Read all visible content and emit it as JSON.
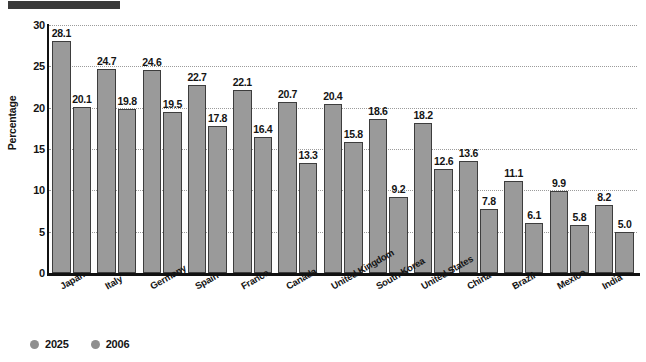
{
  "title_bar": {
    "name": "redacted-title-bar",
    "color": "#3a3a3a"
  },
  "chart_data": {
    "type": "bar",
    "title": "",
    "subtitle": "",
    "xlabel": "",
    "ylabel": "Percentage",
    "ylim": [
      0,
      30
    ],
    "yticks": [
      0,
      5,
      10,
      15,
      20,
      25,
      30
    ],
    "ytick_labels": [
      "0",
      "5",
      "10",
      "15",
      "20",
      "25",
      "30"
    ],
    "grid": true,
    "grid_style": "dotted",
    "legend_position": "bottom-left",
    "categories": [
      "Japan",
      "Italy",
      "Germany",
      "Spain",
      "France",
      "Canada",
      "United Kingdom",
      "South Korea",
      "United States",
      "China",
      "Brazil",
      "Mexico",
      "India"
    ],
    "series": [
      {
        "name": "2025",
        "color": "#9a9a9a",
        "values": [
          28.1,
          24.7,
          24.6,
          22.7,
          22.1,
          20.7,
          20.4,
          18.6,
          18.2,
          13.6,
          11.1,
          9.9,
          8.2
        ],
        "labels": [
          "28.1",
          "24.7",
          "24.6",
          "22.7",
          "22.1",
          "20.7",
          "20.4",
          "18.6",
          "18.2",
          "13.6",
          "11.1",
          "9.9",
          "8.2"
        ]
      },
      {
        "name": "2006",
        "color": "#9a9a9a",
        "values": [
          20.1,
          19.8,
          19.5,
          17.8,
          16.4,
          13.3,
          15.8,
          9.2,
          12.6,
          7.8,
          6.1,
          5.8,
          5.0
        ],
        "labels": [
          "20.1",
          "19.8",
          "19.5",
          "17.8",
          "16.4",
          "13.3",
          "15.8",
          "9.2",
          "12.6",
          "7.8",
          "6.1",
          "5.8",
          "5.0"
        ]
      }
    ]
  },
  "legend": {
    "items": [
      {
        "label": "2025",
        "color": "#8e8e8e"
      },
      {
        "label": "2006",
        "color": "#8e8e8e"
      }
    ]
  }
}
